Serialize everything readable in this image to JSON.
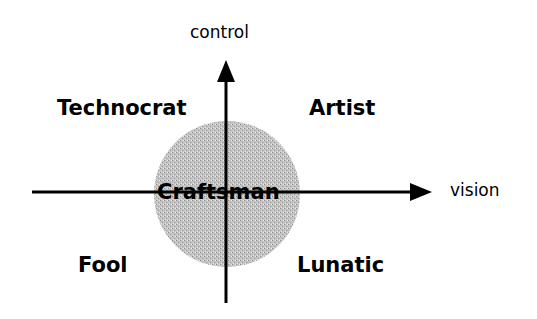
{
  "diagram": {
    "axes": {
      "vertical": {
        "label": "control"
      },
      "horizontal": {
        "label": "vision"
      }
    },
    "center": {
      "label": "Craftsman",
      "fill": "#b8b8b8"
    },
    "quadrants": {
      "top_left": "Technocrat",
      "top_right": "Artist",
      "bottom_left": "Fool",
      "bottom_right": "Lunatic"
    }
  }
}
